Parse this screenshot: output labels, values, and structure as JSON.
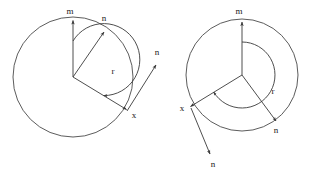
{
  "figure": {
    "title": "",
    "background_color": "#ffffff",
    "stroke_color": "#3a3a3a",
    "label_color": "#1a1a1a"
  },
  "diagrams": [
    {
      "id": "left-diagram",
      "circle": {
        "cx": 73,
        "cy": 77,
        "r": 60
      },
      "center": {
        "x": 73,
        "y": 77
      },
      "labels": {
        "m": "m",
        "n_inner": "n",
        "n_outer": "n",
        "x": "x",
        "r": "r"
      },
      "label_positions": {
        "m": {
          "x": 70,
          "y": 12
        },
        "n_inner": {
          "x": 103,
          "y": 19
        },
        "n_outer": {
          "x": 155,
          "y": 53
        },
        "x": {
          "x": 133,
          "y": 115
        },
        "r": {
          "x": 113,
          "y": 71
        }
      },
      "vectors": [
        {
          "name": "m",
          "from": [
            73,
            77
          ],
          "to": [
            73,
            19
          ]
        },
        {
          "name": "n_inner",
          "from": [
            73,
            77
          ],
          "to": [
            105,
            31
          ]
        },
        {
          "name": "x_radius",
          "from": [
            73,
            77
          ],
          "to": [
            127,
            110
          ]
        },
        {
          "name": "n_outer",
          "from": [
            127,
            111
          ],
          "to": [
            157,
            64
          ]
        }
      ],
      "arc": {
        "name": "r",
        "cx": 73,
        "cy": 77,
        "r": 36,
        "start_deg": 90,
        "end_deg": -31,
        "sweep": "clockwise-reflex"
      }
    },
    {
      "id": "right-diagram",
      "circle": {
        "cx": 242,
        "cy": 75,
        "r": 56
      },
      "center": {
        "x": 242,
        "y": 75
      },
      "labels": {
        "m": "m",
        "n_inner": "n",
        "n_outer": "n",
        "x": "x",
        "r": "r"
      },
      "label_positions": {
        "m": {
          "x": 239,
          "y": 12
        },
        "n_inner": {
          "x": 273,
          "y": 130
        },
        "n_outer": {
          "x": 215,
          "y": 163
        },
        "x": {
          "x": 182,
          "y": 111
        },
        "r": {
          "x": 272,
          "y": 91
        }
      },
      "vectors": [
        {
          "name": "m",
          "from": [
            242,
            75
          ],
          "to": [
            242,
            21
          ]
        },
        {
          "name": "n_inner",
          "from": [
            242,
            75
          ],
          "to": [
            277,
            122
          ]
        },
        {
          "name": "x_radius",
          "from": [
            242,
            75
          ],
          "to": [
            190,
            107
          ]
        },
        {
          "name": "n_outer",
          "from": [
            191,
            108
          ],
          "to": [
            211,
            155
          ]
        }
      ],
      "arc": {
        "name": "r",
        "cx": 242,
        "cy": 75,
        "r": 33,
        "start_deg": 90,
        "end_deg": 211,
        "sweep": "clockwise-reflex"
      }
    }
  ]
}
